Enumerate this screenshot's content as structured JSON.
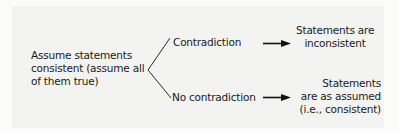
{
  "diagram": {
    "type": "decision-tree",
    "premise": {
      "lines": [
        "Assume statements",
        "consistent (assume all",
        "of them true)"
      ]
    },
    "branches": [
      {
        "label": "Contradiction",
        "outcome": {
          "lines": [
            "Statements are",
            "inconsistent"
          ]
        }
      },
      {
        "label": "No contradiction",
        "outcome": {
          "lines": [
            "Statements",
            "are as assumed",
            "(i.e., consistent)"
          ]
        }
      }
    ],
    "colors": {
      "text": "#1a1a1a",
      "lines": "#2a2a2a",
      "background": "#f3f3f1"
    }
  }
}
